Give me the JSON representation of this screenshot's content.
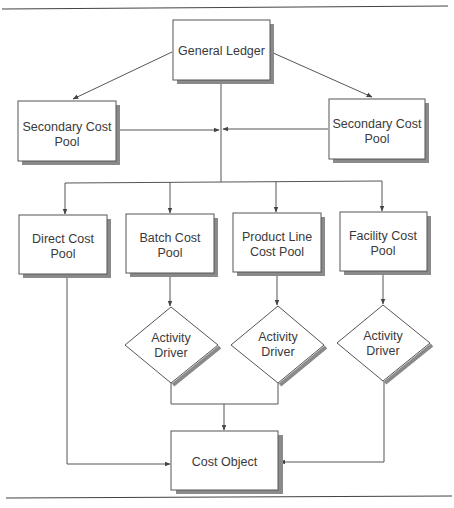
{
  "diagram": {
    "title": "",
    "nodes": {
      "general_ledger": {
        "label": "General Ledger",
        "shape": "rectangle"
      },
      "secondary_left": {
        "line1": "Secondary Cost",
        "line2": "Pool",
        "shape": "rectangle"
      },
      "secondary_right": {
        "line1": "Secondary Cost",
        "line2": "Pool",
        "shape": "rectangle"
      },
      "direct": {
        "line1": "Direct Cost",
        "line2": "Pool",
        "shape": "rectangle"
      },
      "batch": {
        "line1": "Batch Cost",
        "line2": "Pool",
        "shape": "rectangle"
      },
      "product_line": {
        "line1": "Product Line",
        "line2": "Cost Pool",
        "shape": "rectangle"
      },
      "facility": {
        "line1": "Facility Cost",
        "line2": "Pool",
        "shape": "rectangle"
      },
      "driver_batch": {
        "line1": "Activity",
        "line2": "Driver",
        "shape": "diamond"
      },
      "driver_product": {
        "line1": "Activity",
        "line2": "Driver",
        "shape": "diamond"
      },
      "driver_facility": {
        "line1": "Activity",
        "line2": "Driver",
        "shape": "diamond"
      },
      "cost_object": {
        "label": "Cost Object",
        "shape": "rectangle"
      }
    },
    "edges": [
      {
        "from": "General Ledger",
        "to": "Secondary Cost Pool (left)"
      },
      {
        "from": "General Ledger",
        "to": "Secondary Cost Pool (right)"
      },
      {
        "from": "Secondary Cost Pool (left)",
        "to": "General Ledger trunk"
      },
      {
        "from": "Secondary Cost Pool (right)",
        "to": "General Ledger trunk"
      },
      {
        "from": "General Ledger",
        "to": "Direct Cost Pool"
      },
      {
        "from": "General Ledger",
        "to": "Batch Cost Pool"
      },
      {
        "from": "General Ledger",
        "to": "Product Line Cost Pool"
      },
      {
        "from": "General Ledger",
        "to": "Facility Cost Pool"
      },
      {
        "from": "Batch Cost Pool",
        "to": "Activity Driver (batch)"
      },
      {
        "from": "Product Line Cost Pool",
        "to": "Activity Driver (product line)"
      },
      {
        "from": "Facility Cost Pool",
        "to": "Activity Driver (facility)"
      },
      {
        "from": "Activity Driver (batch)",
        "to": "Cost Object"
      },
      {
        "from": "Activity Driver (product line)",
        "to": "Cost Object"
      },
      {
        "from": "Activity Driver (facility)",
        "to": "Cost Object"
      },
      {
        "from": "Direct Cost Pool",
        "to": "Cost Object"
      }
    ],
    "colors": {
      "line": "#555555",
      "shadow": "#8a8a8a",
      "box_fill": "#ffffff",
      "text": "#3a3a3a"
    }
  }
}
